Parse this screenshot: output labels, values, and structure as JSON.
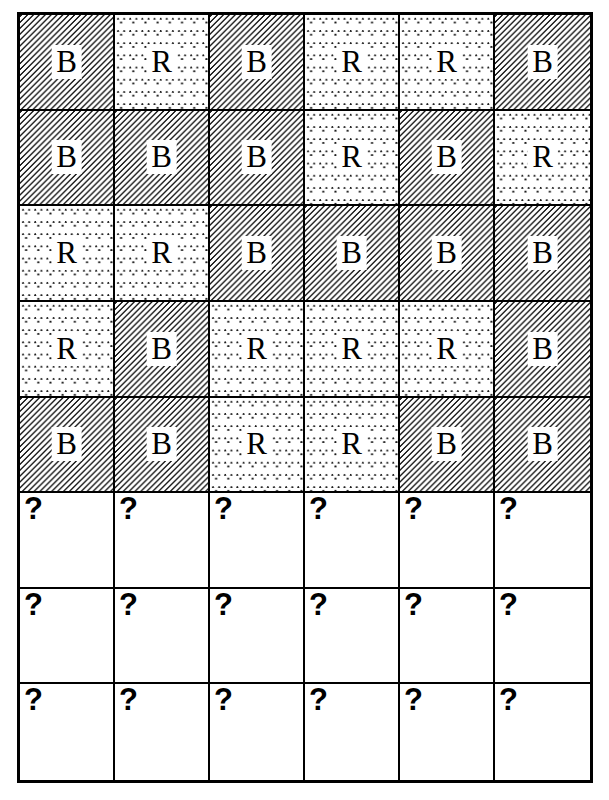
{
  "page": {
    "background_color": "#ffffff",
    "ink_color": "#000000"
  },
  "grid": {
    "columns": 6,
    "rows": 8,
    "border_color": "#000000",
    "unknown_marker": "?",
    "legend": {
      "B": "B",
      "R": "R"
    },
    "cells": [
      [
        {
          "label": "B",
          "fill": "hatch"
        },
        {
          "label": "R",
          "fill": "dots"
        },
        {
          "label": "B",
          "fill": "hatch"
        },
        {
          "label": "R",
          "fill": "dots"
        },
        {
          "label": "R",
          "fill": "dots"
        },
        {
          "label": "B",
          "fill": "hatch"
        }
      ],
      [
        {
          "label": "B",
          "fill": "hatch"
        },
        {
          "label": "B",
          "fill": "hatch"
        },
        {
          "label": "B",
          "fill": "hatch"
        },
        {
          "label": "R",
          "fill": "dots"
        },
        {
          "label": "B",
          "fill": "hatch"
        },
        {
          "label": "R",
          "fill": "dots"
        }
      ],
      [
        {
          "label": "R",
          "fill": "dots"
        },
        {
          "label": "R",
          "fill": "dots"
        },
        {
          "label": "B",
          "fill": "hatch"
        },
        {
          "label": "B",
          "fill": "hatch"
        },
        {
          "label": "B",
          "fill": "hatch"
        },
        {
          "label": "B",
          "fill": "hatch"
        }
      ],
      [
        {
          "label": "R",
          "fill": "dots"
        },
        {
          "label": "B",
          "fill": "hatch"
        },
        {
          "label": "R",
          "fill": "dots"
        },
        {
          "label": "R",
          "fill": "dots"
        },
        {
          "label": "R",
          "fill": "dots"
        },
        {
          "label": "B",
          "fill": "hatch"
        }
      ],
      [
        {
          "label": "B",
          "fill": "hatch"
        },
        {
          "label": "B",
          "fill": "hatch"
        },
        {
          "label": "R",
          "fill": "dots"
        },
        {
          "label": "R",
          "fill": "dots"
        },
        {
          "label": "B",
          "fill": "hatch"
        },
        {
          "label": "B",
          "fill": "hatch"
        }
      ],
      [
        {
          "label": "?",
          "fill": "none"
        },
        {
          "label": "?",
          "fill": "none"
        },
        {
          "label": "?",
          "fill": "none"
        },
        {
          "label": "?",
          "fill": "none"
        },
        {
          "label": "?",
          "fill": "none"
        },
        {
          "label": "?",
          "fill": "none"
        }
      ],
      [
        {
          "label": "?",
          "fill": "none"
        },
        {
          "label": "?",
          "fill": "none"
        },
        {
          "label": "?",
          "fill": "none"
        },
        {
          "label": "?",
          "fill": "none"
        },
        {
          "label": "?",
          "fill": "none"
        },
        {
          "label": "?",
          "fill": "none"
        }
      ],
      [
        {
          "label": "?",
          "fill": "none"
        },
        {
          "label": "?",
          "fill": "none"
        },
        {
          "label": "?",
          "fill": "none"
        },
        {
          "label": "?",
          "fill": "none"
        },
        {
          "label": "?",
          "fill": "none"
        },
        {
          "label": "?",
          "fill": "none"
        }
      ]
    ]
  }
}
